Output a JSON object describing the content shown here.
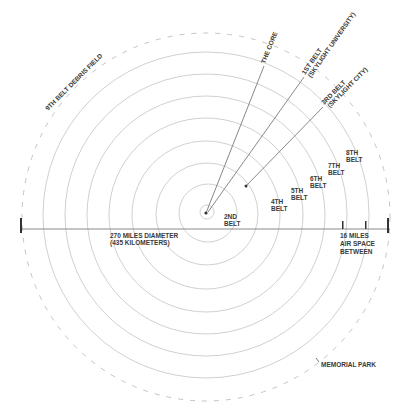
{
  "diagram": {
    "center": {
      "x": 206,
      "y": 216
    },
    "colors": {
      "ring": "#bdbdbd",
      "line": "#8a8a8a",
      "text": "#3a3a3a",
      "tick": "#333333"
    },
    "labels": {
      "core": "THE CORE",
      "belt1_line1": "1ST BELT",
      "belt1_line2": "(SKYLIGHT UNIVERSITY)",
      "belt3_line1": "3RD BELT",
      "belt3_line2": "(SKYLIGHT CITY)",
      "belt2_line1": "2ND",
      "belt2_line2": "BELT",
      "belt4_line1": "4TH",
      "belt4_line2": "BELT",
      "belt5_line1": "5TH",
      "belt5_line2": "BELT",
      "belt6_line1": "6TH",
      "belt6_line2": "BELT",
      "belt7_line1": "7TH",
      "belt7_line2": "BELT",
      "belt8_line1": "8TH",
      "belt8_line2": "BELT",
      "debris": "9TH BELT DEBRIS FIELD",
      "diameter_line1": "270 MILES DIAMETER",
      "diameter_line2": "(435 KILOMETERS)",
      "airspace_line1": "16 MILES",
      "airspace_line2": "AIR SPACE",
      "airspace_line3": "BETWEEN",
      "memorial": "MEMORIAL PARK"
    }
  }
}
